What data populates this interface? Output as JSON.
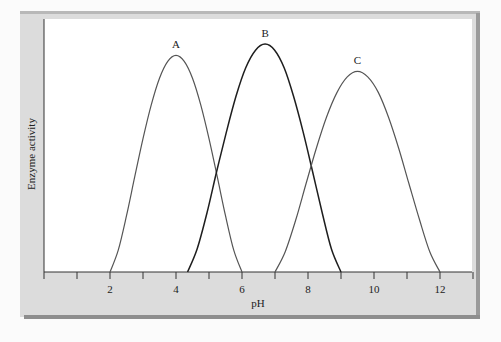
{
  "chart_data": {
    "type": "line",
    "title": "",
    "xlabel": "pH",
    "ylabel": "Enzyme activity",
    "xlim": [
      0,
      13
    ],
    "ylim": [
      0,
      1.11
    ],
    "grid": false,
    "legend": "none (curves labeled at peaks)",
    "x_ticks": [
      0,
      1,
      2,
      3,
      4,
      5,
      6,
      7,
      8,
      9,
      10,
      11,
      12,
      13
    ],
    "x_tick_labels": [
      {
        "value": 2,
        "label": "2"
      },
      {
        "value": 4,
        "label": "4"
      },
      {
        "value": 6,
        "label": "6"
      },
      {
        "value": 8,
        "label": "8"
      },
      {
        "value": 10,
        "label": "10"
      },
      {
        "value": 12,
        "label": "12"
      }
    ],
    "series": [
      {
        "name": "A",
        "label": "A",
        "peak_pH": 4.0,
        "peak_activity": 0.95,
        "color": "#555555",
        "x": [
          2.0,
          2.25,
          2.5,
          2.75,
          3.0,
          3.25,
          3.5,
          3.75,
          4.0,
          4.25,
          4.5,
          4.75,
          5.0,
          5.25,
          5.5,
          5.75,
          6.0
        ],
        "y": [
          0,
          0.096,
          0.247,
          0.418,
          0.585,
          0.733,
          0.85,
          0.924,
          0.95,
          0.924,
          0.85,
          0.733,
          0.585,
          0.418,
          0.247,
          0.096,
          0
        ]
      },
      {
        "name": "B",
        "label": "B",
        "peak_pH": 6.7,
        "peak_activity": 1.0,
        "color": "#1e1e1e",
        "x": [
          4.35,
          4.64,
          4.94,
          5.23,
          5.53,
          5.82,
          6.11,
          6.41,
          6.7,
          6.99,
          7.28,
          7.56,
          7.85,
          8.14,
          8.43,
          8.71,
          9.0
        ],
        "y": [
          0,
          0.101,
          0.26,
          0.44,
          0.616,
          0.772,
          0.895,
          0.973,
          1.0,
          0.973,
          0.895,
          0.772,
          0.616,
          0.44,
          0.26,
          0.101,
          0
        ]
      },
      {
        "name": "C",
        "label": "C",
        "peak_pH": 9.5,
        "peak_activity": 0.88,
        "color": "#555555",
        "x": [
          7.0,
          7.31,
          7.63,
          7.94,
          8.25,
          8.56,
          8.88,
          9.19,
          9.5,
          9.81,
          10.13,
          10.44,
          10.75,
          11.06,
          11.38,
          11.69,
          12.0
        ],
        "y": [
          0,
          0.089,
          0.229,
          0.387,
          0.542,
          0.679,
          0.788,
          0.856,
          0.88,
          0.856,
          0.788,
          0.679,
          0.542,
          0.387,
          0.229,
          0.089,
          0
        ]
      }
    ]
  }
}
